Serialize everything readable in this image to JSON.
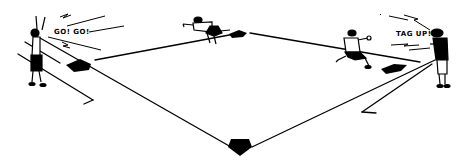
{
  "illustration": {
    "subject": "baseball infield line drawing",
    "callouts": {
      "left_coach": "GO! GO!",
      "right_coach": "TAG UP!"
    },
    "figures": [
      {
        "role": "left-coach",
        "pose": "arms raised"
      },
      {
        "role": "runner-second",
        "pose": "diving toward bag"
      },
      {
        "role": "runner-third",
        "pose": "running"
      },
      {
        "role": "right-coach",
        "pose": "cupping hands, shouting"
      }
    ],
    "bases": [
      "first-base",
      "second-base",
      "third-base",
      "home-plate"
    ],
    "colors": {
      "ink": "#000000",
      "paper": "#ffffff"
    }
  }
}
